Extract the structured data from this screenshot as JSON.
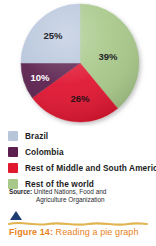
{
  "figure": {
    "caption_kicker": "Figure 14:",
    "caption_text": " Reading a pie graph",
    "triangle_icon": "triangle-up-icon",
    "wave_icon": "wavy-rule-icon"
  },
  "source": {
    "kicker": "Source:",
    "line_1": " United Nations, Food and",
    "line_2": "Agriculture Organization"
  },
  "legend": {
    "items": [
      {
        "label": "Brazil",
        "color": "#b8c6dc"
      },
      {
        "label": "Colombia",
        "color": "#5c2050"
      },
      {
        "label": "Rest of Middle and South America",
        "color": "#e01830"
      },
      {
        "label": "Rest of the world",
        "color": "#a8c88a"
      }
    ]
  },
  "colors": {
    "brazil": "#b8c6dc",
    "colombia": "#5c2050",
    "rest_americas": "#e01830",
    "rest_world": "#a8c88a",
    "caption_orange": "#e8821a",
    "triangle_navy": "#1f3c72",
    "wave_gold": "#e0b450",
    "background": "#ffffff"
  },
  "chart_data": {
    "type": "pie",
    "title": "",
    "legend_position": "below",
    "unit": "%",
    "start_angle_deg": 0,
    "direction": "clockwise",
    "categories": [
      "Rest of the world",
      "Rest of Middle and South America",
      "Colombia",
      "Brazil"
    ],
    "values": [
      39,
      26,
      10,
      25
    ],
    "labels": [
      "39%",
      "26%",
      "10%",
      "25%"
    ],
    "slices": [
      {
        "name": "Rest of the world",
        "value": 39,
        "label": "39%",
        "color": "#a8c88a",
        "label_color": "#25252b",
        "label_x": 108,
        "label_y": 57
      },
      {
        "name": "Rest of Middle and South America",
        "value": 26,
        "label": "26%",
        "color": "#e01830",
        "label_color": "#2a1216",
        "label_x": 80,
        "label_y": 99
      },
      {
        "name": "Colombia",
        "value": 10,
        "label": "10%",
        "color": "#5c2050",
        "label_color": "#ffffff",
        "label_x": 40,
        "label_y": 78
      },
      {
        "name": "Brazil",
        "value": 25,
        "label": "25%",
        "color": "#b8c6dc",
        "label_color": "#25252b",
        "label_x": 53,
        "label_y": 36
      }
    ]
  }
}
